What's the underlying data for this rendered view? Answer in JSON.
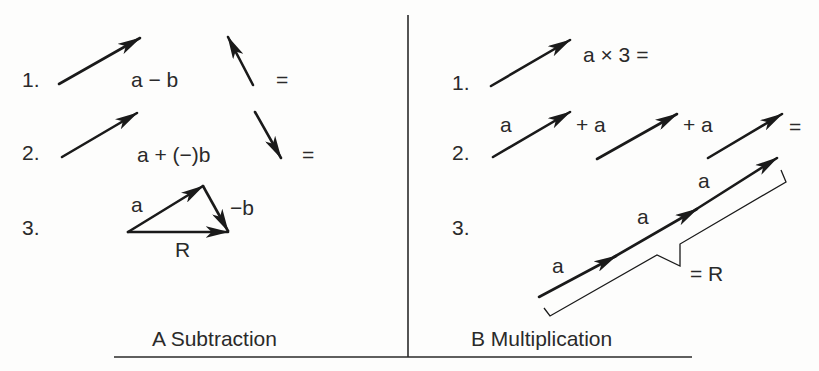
{
  "panels": {
    "subtraction": {
      "caption": "A Subtraction",
      "rows": [
        {
          "index": "1.",
          "expression": "a − b",
          "equals": "="
        },
        {
          "index": "2.",
          "expression": "a + (−)b",
          "equals": "="
        },
        {
          "index": "3.",
          "labels": {
            "a": "a",
            "neg_b": "−b",
            "result": "R"
          }
        }
      ]
    },
    "multiplication": {
      "caption": "B Multiplication",
      "rows": [
        {
          "index": "1.",
          "expression": "a × 3 ="
        },
        {
          "index": "2.",
          "terms": [
            "a",
            "+ a",
            "+ a"
          ],
          "equals": "="
        },
        {
          "index": "3.",
          "labels": [
            "a",
            "a",
            "a"
          ],
          "result": "= R"
        }
      ]
    }
  },
  "colors": {
    "ink": "#1a1a1a",
    "background": "#fdfdfc"
  }
}
